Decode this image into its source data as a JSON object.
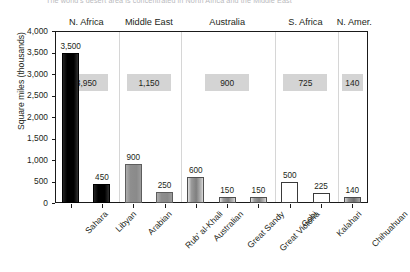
{
  "caption": "The world's desert area is concentrated in North Africa and the Middle East",
  "chart_data": {
    "type": "bar",
    "title": "",
    "xlabel": "",
    "ylabel": "Square miles (thousands)",
    "ylim": [
      0,
      4000
    ],
    "yticks": [
      "0",
      "500",
      "1,000",
      "1,500",
      "2,000",
      "2,500",
      "3,000",
      "3,500",
      "4,000"
    ],
    "ytick_values": [
      0,
      500,
      1000,
      1500,
      2000,
      2500,
      3000,
      3500,
      4000
    ],
    "grid": false,
    "legend": "none",
    "categories": [
      "Sahara",
      "Libyan",
      "Arabian",
      "Rub' al-Khali",
      "Australian",
      "Great Sandy",
      "Great Victoria",
      "Gobi",
      "Kalahari",
      "Chihuahuan"
    ],
    "values": [
      3500,
      450,
      900,
      250,
      600,
      150,
      150,
      500,
      225,
      140
    ],
    "value_labels": [
      "3,500",
      "450",
      "900",
      "250",
      "600",
      "150",
      "150",
      "500",
      "225",
      "140"
    ],
    "groups": [
      {
        "region": "N. Africa",
        "total": 3950,
        "total_label": "3,950",
        "style": "black",
        "bars": [
          {
            "name": "Sahara",
            "value": 3500,
            "label": "3,500"
          },
          {
            "name": "Libyan",
            "value": 450,
            "label": "450"
          }
        ]
      },
      {
        "region": "Middle East",
        "total": 1150,
        "total_label": "1,150",
        "style": "gray",
        "bars": [
          {
            "name": "Arabian",
            "value": 900,
            "label": "900"
          },
          {
            "name": "Rub' al-Khali",
            "value": 250,
            "label": "250"
          }
        ]
      },
      {
        "region": "Australia",
        "total": 900,
        "total_label": "900",
        "style": "grad",
        "bars": [
          {
            "name": "Australian",
            "value": 600,
            "label": "600"
          },
          {
            "name": "Great Sandy",
            "value": 150,
            "label": "150"
          },
          {
            "name": "Great Victoria",
            "value": 150,
            "label": "150"
          }
        ]
      },
      {
        "region": "S. Africa",
        "total": 725,
        "total_label": "725",
        "style": "outline",
        "bars": [
          {
            "name": "Gobi",
            "value": 500,
            "label": "500"
          },
          {
            "name": "Kalahari",
            "value": 225,
            "label": "225"
          }
        ]
      },
      {
        "region": "N. Amer.",
        "total": 140,
        "total_label": "140",
        "style": "darkgrad",
        "bars": [
          {
            "name": "Chihuahuan",
            "value": 140,
            "label": "140"
          }
        ]
      }
    ]
  },
  "colors": {
    "frame": "#1a1a1a",
    "divider": "#d6d6d6",
    "total_box": "#d4d4d4",
    "bar_black": "#000000",
    "bar_gray": "#8a8a8a",
    "text": "#231f20"
  }
}
